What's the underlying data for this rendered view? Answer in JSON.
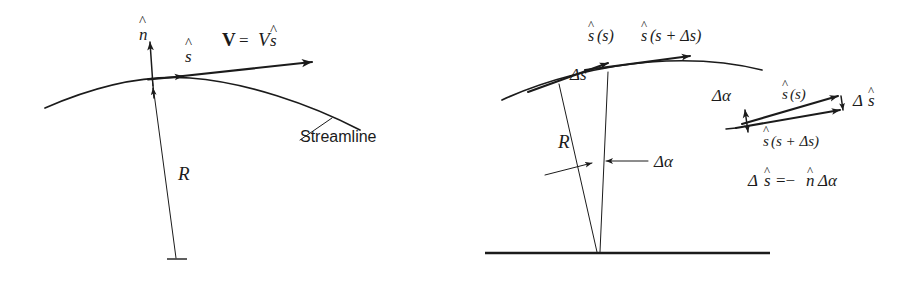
{
  "figure": {
    "ink_color": "#1b1b1b",
    "background_color": "#ffffff"
  },
  "left_panel": {
    "name": "streamline-with-radius-of-curvature",
    "labels": {
      "normal_vector": "n",
      "normal_hat": "^",
      "tangent_vector": "s",
      "tangent_hat": "^",
      "velocity_bold": "V",
      "velocity_equals": "=",
      "velocity_magnitude": "V",
      "velocity_unit": "s",
      "velocity_hat": "^",
      "radius": "R",
      "streamline": "Streamline"
    }
  },
  "right_panel": {
    "name": "delta-s-wedge-construction",
    "labels": {
      "tangent_at_s_base": "s",
      "tangent_at_s_arg": "(s)",
      "tangent_at_s_hat": "^",
      "tangent_at_s_plus_base": "s",
      "tangent_at_s_plus_arg": "(s + Δs)",
      "tangent_at_s_plus_hat": "^",
      "arc_length": "Δs",
      "radius": "R",
      "delta_alpha": "Δα"
    }
  },
  "inset_panel": {
    "name": "vector-difference-detail",
    "labels": {
      "delta_alpha": "Δα",
      "tangent_at_s_base": "s",
      "tangent_at_s_arg": "(s)",
      "tangent_at_s_hat": "^",
      "tangent_at_s_plus_base": "s",
      "tangent_at_s_plus_arg": "(s + Δs)",
      "tangent_at_s_plus_hat": "^",
      "delta_s_hat_base": "Δ",
      "delta_s_hat_letter": "s",
      "delta_s_hat_mark": "^",
      "equation_lhs_delta": "Δ",
      "equation_lhs_letter": "s",
      "equation_lhs_hat": "^",
      "equation_rel": "=−",
      "equation_rhs_letter": "n",
      "equation_rhs_hat": "^",
      "equation_rhs_tail": "Δα"
    }
  }
}
